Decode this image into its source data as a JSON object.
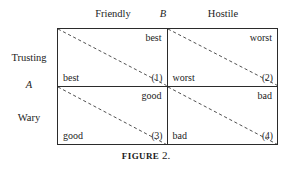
{
  "figure": {
    "caption_word": "FIGURE",
    "caption_number": "2."
  },
  "axes": {
    "column_player_label": "B",
    "row_player_label": "A",
    "column_headers": [
      "Friendly",
      "Hostile"
    ],
    "row_headers": [
      "Trusting",
      "Wary"
    ]
  },
  "matrix": {
    "rows": [
      {
        "row_label": "Trusting",
        "cells": [
          {
            "index": "(1)",
            "column_label": "Friendly",
            "upper_right_payoff": "best",
            "lower_left_payoff": "best"
          },
          {
            "index": "(2)",
            "column_label": "Hostile",
            "upper_right_payoff": "worst",
            "lower_left_payoff": "worst"
          }
        ]
      },
      {
        "row_label": "Wary",
        "cells": [
          {
            "index": "(3)",
            "column_label": "Friendly",
            "upper_right_payoff": "good",
            "lower_left_payoff": "good"
          },
          {
            "index": "(4)",
            "column_label": "Hostile",
            "upper_right_payoff": "bad",
            "lower_left_payoff": "bad"
          }
        ]
      }
    ]
  },
  "colors": {
    "rule": "#2b2b2b",
    "diagonal": "#3a3a3a",
    "text": "#232323",
    "background": "#ffffff"
  }
}
